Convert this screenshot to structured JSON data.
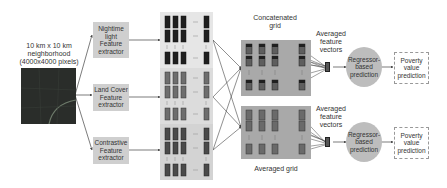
{
  "input": {
    "title_line1": "10 km x 10 km",
    "title_line2": "neighborhood",
    "title_line3": "(4000x4000 pixels)"
  },
  "extractors": [
    {
      "line1": "Nightime",
      "line2": "light",
      "line3": "Feature",
      "line4": "extractor"
    },
    {
      "line1": "Land Cover",
      "line2": "Feature",
      "line3": "extractor"
    },
    {
      "line1": "Contrastive",
      "line2": "Feature",
      "line3": "extractor"
    }
  ],
  "grids": {
    "concatenated_line1": "Concatenated",
    "concatenated_line2": "grid",
    "averaged": "Averaged grid"
  },
  "vectors": {
    "top_line1": "Averaged",
    "top_line2": "feature",
    "top_line3": "vectors",
    "bottom_line1": "Averaged",
    "bottom_line2": "feature",
    "bottom_line3": "vectors"
  },
  "regressors": [
    {
      "line1": "Regressor-",
      "line2": "based",
      "line3": "prediction"
    },
    {
      "line1": "Regressor-",
      "line2": "based",
      "line3": "prediction"
    }
  ],
  "outputs": [
    {
      "line1": "Poverty",
      "line2": "value",
      "line3": "prediction"
    },
    {
      "line1": "Poverty",
      "line2": "value",
      "line3": "prediction"
    }
  ],
  "colors": {
    "band_dark": "#1f1f1f",
    "band_mid": "#6e6e6e",
    "band_light": "#8a8a8a",
    "grid_bg": "#a9a9a9",
    "circle": "#bdbdbd",
    "box": "#cfcfcf"
  }
}
